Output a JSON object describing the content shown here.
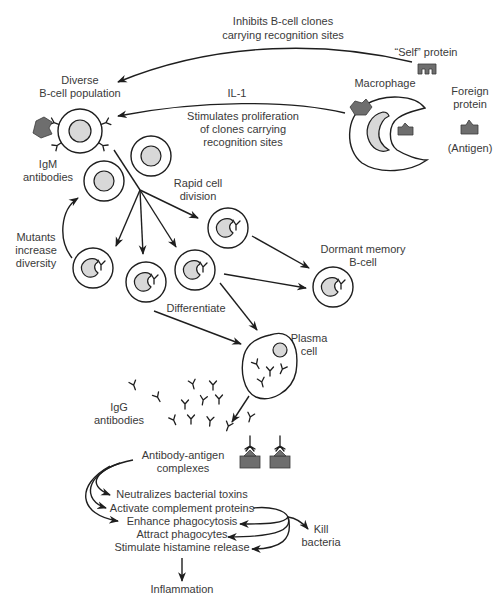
{
  "diagram": {
    "labels": {
      "inhibits_line1": "Inhibits B-cell clones",
      "inhibits_line2": "carrying recognition sites",
      "self_protein": "“Self” protein",
      "diverse_line1": "Diverse",
      "diverse_line2": "B-cell population",
      "macrophage": "Macrophage",
      "foreign_line1": "Foreign",
      "foreign_line2": "protein",
      "antigen": "(Antigen)",
      "il1": "IL-1",
      "stimulates_line1": "Stimulates proliferation",
      "stimulates_line2": "of clones carrying",
      "stimulates_line3": "recognition sites",
      "igm_line1": "IgM",
      "igm_line2": "antibodies",
      "rapid_line1": "Rapid cell",
      "rapid_line2": "division",
      "mutants_line1": "Mutants",
      "mutants_line2": "increase",
      "mutants_line3": "diversity",
      "dormant_line1": "Dormant memory",
      "dormant_line2": "B-cell",
      "differentiate": "Differentiate",
      "plasma_line1": "Plasma",
      "plasma_line2": "cell",
      "igg_line1": "IgG",
      "igg_line2": "antibodies",
      "complex_line1": "Antibody-antigen",
      "complex_line2": "complexes",
      "effects": [
        "Neutralizes bacterial toxins",
        "Activate complement proteins",
        "Enhance phagocytosis",
        "Attract phagocytes",
        "Stimulate histamine release"
      ],
      "kill_line1": "Kill",
      "kill_line2": "bacteria",
      "inflammation": "Inflammation"
    },
    "colors": {
      "line": "#1e1e1e",
      "text": "#3a3a3a",
      "nucleus": "#d8d8d8",
      "protein": "#6e6e6e"
    }
  }
}
